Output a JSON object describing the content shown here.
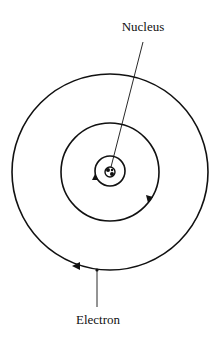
{
  "diagram": {
    "labels": {
      "nucleus": "Nucleus",
      "electron": "Electron"
    },
    "orbits": [
      {
        "name": "inner-orbit",
        "radius": 15,
        "direction": "clockwise"
      },
      {
        "name": "middle-orbit",
        "radius": 50,
        "direction": "clockwise"
      },
      {
        "name": "outer-orbit",
        "radius": 99,
        "direction": "clockwise"
      }
    ],
    "colors": {
      "stroke": "#111111",
      "background": "#ffffff"
    }
  }
}
